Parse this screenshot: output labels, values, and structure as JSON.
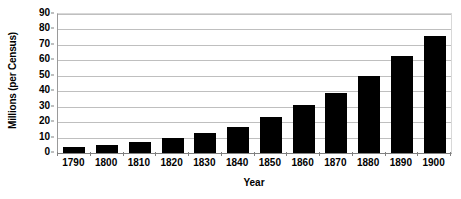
{
  "chart_data": {
    "type": "bar",
    "title": "",
    "xlabel": "Year",
    "ylabel": "Millions (per Census)",
    "categories": [
      "1790",
      "1800",
      "1810",
      "1820",
      "1830",
      "1840",
      "1850",
      "1860",
      "1870",
      "1880",
      "1890",
      "1900"
    ],
    "values": [
      4,
      5,
      7,
      10,
      13,
      17,
      23,
      31,
      39,
      50,
      63,
      76
    ],
    "ylim": [
      0,
      90
    ],
    "ytick_labels": [
      "0",
      "10",
      "20",
      "30",
      "40",
      "50",
      "60",
      "70",
      "80",
      "90"
    ],
    "ytick_values": [
      0,
      10,
      20,
      30,
      40,
      50,
      60,
      70,
      80,
      90
    ],
    "grid": true,
    "legend": "none",
    "bar_color": "#000000",
    "grid_color": "#bfbfbf",
    "axis_color": "#808080",
    "background_color": "#ffffff"
  }
}
